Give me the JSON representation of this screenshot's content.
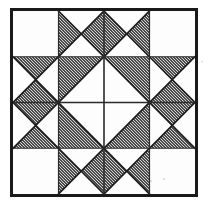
{
  "canvas": {
    "width": 209,
    "height": 210,
    "background": "#ffffff"
  },
  "figure": {
    "kind": "quilt-block-diagram",
    "title": "Four-Patch Star Quilt Block",
    "frame": {
      "x": 10,
      "y": 8,
      "width": 188,
      "height": 189,
      "border_color": "#1a1a1a",
      "border_width": 3
    },
    "grid": {
      "rows": 4,
      "cols": 4,
      "line_color": "#2b2b2b",
      "line_width": 1.6,
      "inner_line_width": 1.2
    },
    "colors": {
      "shaded": "#8e8e8e",
      "shaded_dither_dark": "#4a4a4a",
      "shaded_dither_light": "#d6d6d6",
      "plain": "#fdfdfd",
      "ink": "#1a1a1a",
      "paper": "#ffffff"
    },
    "legend": {
      "shaded_label": "shaded fabric",
      "plain_label": "plain fabric"
    }
  },
  "chart_data": {
    "type": "heatmap",
    "title": "Four-Patch Star Quilt Block",
    "xlabel": "",
    "ylabel": "",
    "categories": [
      "col 1",
      "col 2",
      "col 3",
      "col 4"
    ],
    "row_labels": [
      "row 1",
      "row 2",
      "row 3",
      "row 4"
    ],
    "unit_types": {
      "plain": "solid plain square",
      "hourglass-lr": "hourglass unit, left and right triangles shaded",
      "hourglass-tb": "hourglass unit, top and bottom triangles shaded",
      "hst-ul": "half-square triangle, upper-left shaded",
      "hst-ur": "half-square triangle, upper-right shaded",
      "hst-ll": "half-square triangle, lower-left shaded",
      "hst-lr": "half-square triangle, lower-right shaded"
    },
    "cells": [
      [
        "plain",
        "hourglass-lr",
        "hourglass-lr",
        "plain"
      ],
      [
        "hourglass-tb",
        "hst-ul",
        "hst-ur",
        "hourglass-tb"
      ],
      [
        "hourglass-tb",
        "hst-ll",
        "hst-lr",
        "hourglass-tb"
      ],
      [
        "plain",
        "hourglass-lr",
        "hourglass-lr",
        "plain"
      ]
    ],
    "shaded_triangle_count": 20,
    "plain_triangle_count": 20,
    "grid_on": true,
    "legend_position": "none"
  }
}
